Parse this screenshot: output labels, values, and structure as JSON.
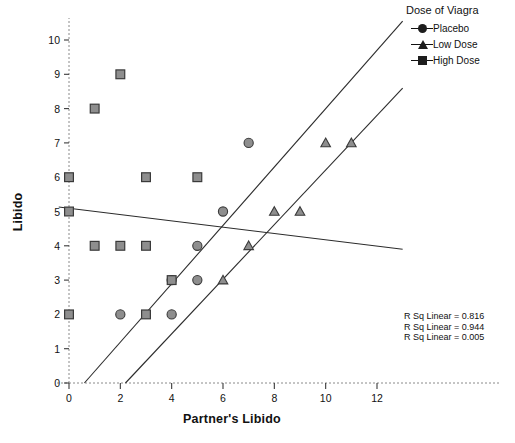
{
  "chart_data": {
    "type": "scatter",
    "title": "",
    "xlabel": "Partner's Libido",
    "ylabel": "Libido",
    "xlim": [
      -0.9,
      13.0
    ],
    "ylim": [
      0,
      10.6
    ],
    "xticks": [
      0,
      2,
      4,
      6,
      8,
      10,
      12
    ],
    "yticks": [
      0,
      1,
      2,
      3,
      4,
      5,
      6,
      7,
      8,
      9,
      10
    ],
    "grid": false,
    "legend_position": "top-right",
    "series": [
      {
        "name": "Placebo",
        "marker": "circle",
        "color": "#808080",
        "points": [
          [
            2,
            2
          ],
          [
            4,
            2
          ],
          [
            4,
            3
          ],
          [
            5,
            3
          ],
          [
            5,
            4
          ],
          [
            6,
            5
          ],
          [
            7,
            7
          ]
        ]
      },
      {
        "name": "Low Dose",
        "marker": "triangle",
        "color": "#808080",
        "points": [
          [
            6,
            3
          ],
          [
            7,
            4
          ],
          [
            8,
            5
          ],
          [
            9,
            5
          ],
          [
            10,
            7
          ],
          [
            11,
            7
          ]
        ]
      },
      {
        "name": "High Dose",
        "marker": "square",
        "color": "#8c8c8c",
        "points": [
          [
            0,
            2
          ],
          [
            3,
            2
          ],
          [
            1,
            4
          ],
          [
            2,
            4
          ],
          [
            3,
            4
          ],
          [
            0,
            5
          ],
          [
            0,
            6
          ],
          [
            3,
            6
          ],
          [
            5,
            6
          ],
          [
            1,
            8
          ],
          [
            2,
            9
          ],
          [
            4,
            3
          ]
        ]
      }
    ],
    "fit_lines": [
      {
        "name": "Placebo fit",
        "x0": 0.6,
        "y0": 0.0,
        "x1": 13.0,
        "y1": 10.55
      },
      {
        "name": "Low Dose fit",
        "x0": 2.2,
        "y0": 0.0,
        "x1": 13.0,
        "y1": 8.6
      },
      {
        "name": "High Dose fit",
        "x0": -0.4,
        "y0": 5.13,
        "x1": 13.0,
        "y1": 3.9
      }
    ],
    "annotations": [
      "R Sq Linear = 0.816",
      "R Sq Linear = 0.944",
      "R Sq Linear = 0.005"
    ]
  },
  "legend": {
    "title": "Dose of Viagra",
    "items": [
      {
        "label": "Placebo",
        "icon": "circle-marker-icon"
      },
      {
        "label": "Low Dose",
        "icon": "triangle-marker-icon"
      },
      {
        "label": "High Dose",
        "icon": "square-marker-icon"
      }
    ]
  },
  "axes": {
    "x_title": "Partner's Libido",
    "y_title": "Libido",
    "x_tick_labels": [
      "0",
      "2",
      "4",
      "6",
      "8",
      "10",
      "12"
    ],
    "y_tick_labels": [
      "0",
      "1",
      "2",
      "3",
      "4",
      "5",
      "6",
      "7",
      "8",
      "9",
      "10"
    ]
  },
  "rsq": {
    "line1": "R Sq Linear = 0.816",
    "line2": "R Sq Linear = 0.944",
    "line3": "R Sq Linear = 0.005"
  },
  "colors": {
    "marker_fill": "#8e8e8e",
    "marker_stroke": "#3a3a3a",
    "axis": "#4a4a4a",
    "fit_line": "#2b2b2b"
  }
}
